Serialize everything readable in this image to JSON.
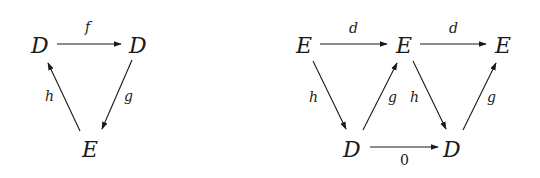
{
  "diagrams": [
    {
      "name": "triangle",
      "nodes": [
        {
          "id": "D1",
          "label": "D"
        },
        {
          "id": "D2",
          "label": "D"
        },
        {
          "id": "E1",
          "label": "E"
        }
      ],
      "arrows": [
        {
          "from": "D1",
          "to": "D2",
          "label": "f"
        },
        {
          "from": "D2",
          "to": "E1",
          "label": "g"
        },
        {
          "from": "E1",
          "to": "D1",
          "label": "h"
        }
      ]
    },
    {
      "name": "unrolled-sequence",
      "nodes": [
        {
          "id": "E1",
          "label": "E"
        },
        {
          "id": "E2",
          "label": "E"
        },
        {
          "id": "E3",
          "label": "E"
        },
        {
          "id": "D1",
          "label": "D"
        },
        {
          "id": "D2",
          "label": "D"
        }
      ],
      "arrows": [
        {
          "from": "E1",
          "to": "E2",
          "label": "d"
        },
        {
          "from": "E2",
          "to": "E3",
          "label": "d"
        },
        {
          "from": "E1",
          "to": "D1",
          "label": "h"
        },
        {
          "from": "D1",
          "to": "E2",
          "label": "g"
        },
        {
          "from": "E2",
          "to": "D2",
          "label": "h"
        },
        {
          "from": "D2",
          "to": "E3",
          "label": "g"
        },
        {
          "from": "D1",
          "to": "D2",
          "label": "0"
        }
      ]
    }
  ]
}
